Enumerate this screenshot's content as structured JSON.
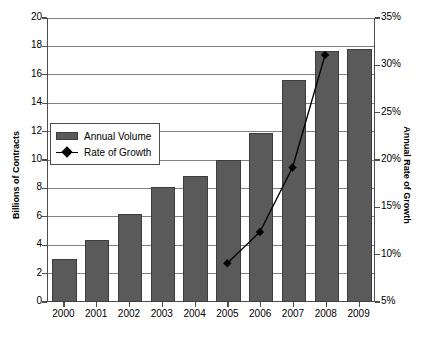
{
  "chart_data": {
    "type": "bar",
    "title": "",
    "subtitle": "",
    "xlabel": "",
    "ylabel": "Billions of Contracts",
    "y2label": "Annual Rate of Growth",
    "categories": [
      "2000",
      "2001",
      "2002",
      "2003",
      "2004",
      "2005",
      "2006",
      "2007",
      "2008",
      "2009"
    ],
    "ylim": [
      0,
      20
    ],
    "y2lim": [
      5,
      35
    ],
    "ytick_labels": [
      "0",
      "2",
      "4",
      "6",
      "8",
      "10",
      "12",
      "14",
      "16",
      "18",
      "20"
    ],
    "ytick_values": [
      0,
      2,
      4,
      6,
      8,
      10,
      12,
      14,
      16,
      18,
      20
    ],
    "y2tick_labels": [
      "5%",
      "10%",
      "15%",
      "20%",
      "25%",
      "30%",
      "35%"
    ],
    "y2tick_values": [
      5,
      10,
      15,
      20,
      25,
      30,
      35
    ],
    "grid": true,
    "legend_position": "upper-left-inside",
    "series": [
      {
        "name": "Annual Volume",
        "type": "bar",
        "axis": "left",
        "color": "#5a5a5a",
        "values": [
          3.0,
          4.4,
          6.2,
          8.1,
          8.9,
          10.0,
          11.9,
          15.6,
          17.7,
          17.8
        ]
      },
      {
        "name": "Rate of Growth",
        "type": "line",
        "axis": "right",
        "color": "#000000",
        "marker": "diamond",
        "x": [
          "2005",
          "2006",
          "2007",
          "2008"
        ],
        "values": [
          9.1,
          12.4,
          19.2,
          31.1
        ]
      }
    ]
  },
  "legend": {
    "items": [
      {
        "label": "Annual Volume",
        "marker": "bar-swatch"
      },
      {
        "label": "Rate of Growth",
        "marker": "line-diamond"
      }
    ]
  }
}
